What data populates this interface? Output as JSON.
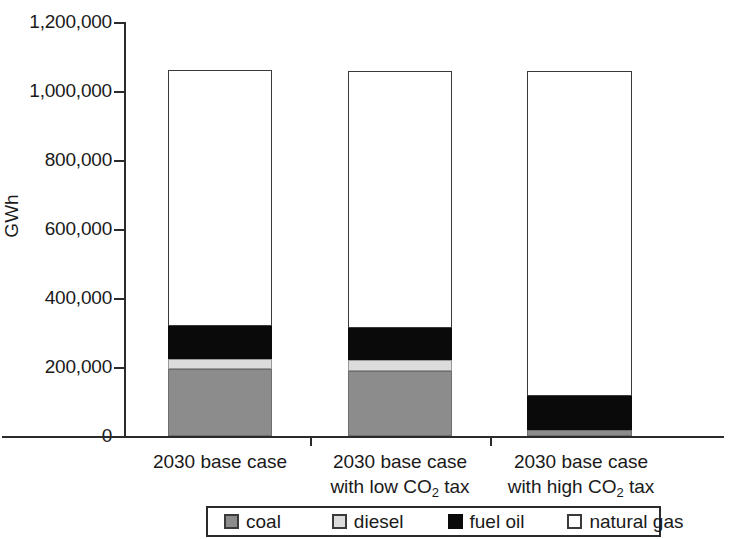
{
  "chart_data": {
    "type": "bar",
    "subtype": "stacked-bar",
    "title": "",
    "xlabel": "",
    "ylabel": "GWh",
    "ylim": [
      0,
      1200000
    ],
    "ytick_values": [
      0,
      200000,
      400000,
      600000,
      800000,
      1000000,
      1200000
    ],
    "ytick_labels": [
      "0",
      "200,000",
      "400,000",
      "600,000",
      "800,000",
      "1,000,000",
      "1,200,000"
    ],
    "grid": false,
    "legend_position": "bottom",
    "categories": [
      {
        "line1": "2030  base case",
        "line2": ""
      },
      {
        "line1": "2030 base case",
        "line2": "with low CO",
        "line2_sub": "2",
        "line2_tail": " tax"
      },
      {
        "line1": "2030 base case",
        "line2": "with high CO",
        "line2_sub": "2",
        "line2_tail": " tax"
      }
    ],
    "category_labels": [
      "2030  base case",
      "2030 base case with low CO2 tax",
      "2030 base case with high CO2 tax"
    ],
    "series": [
      {
        "name": "coal",
        "color": "#8c8c8c",
        "values": [
          190000,
          185000,
          18000
        ]
      },
      {
        "name": "diesel",
        "color": "#dcdcdc",
        "values": [
          28000,
          30000,
          0
        ]
      },
      {
        "name": "fuel oil",
        "color": "#0a0a0a",
        "values": [
          93000,
          90000,
          95000
        ]
      },
      {
        "name": "natural gas",
        "color": "#ffffff",
        "values": [
          724000,
          725000,
          917000
        ]
      }
    ],
    "totals": [
      1035000,
      1030000,
      1030000
    ],
    "legend": [
      {
        "label": "coal",
        "swatch": "coal"
      },
      {
        "label": "diesel",
        "swatch": "diesel"
      },
      {
        "label": "fuel oil",
        "swatch": "fueloil"
      },
      {
        "label": "natural gas",
        "swatch": "naturalgas"
      }
    ]
  }
}
